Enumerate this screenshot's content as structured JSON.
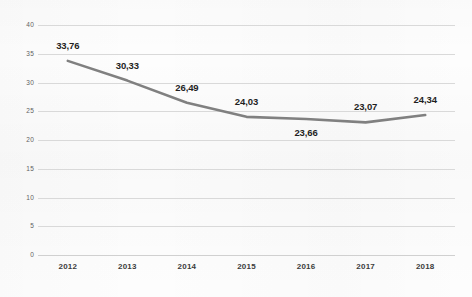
{
  "chart_data": {
    "type": "line",
    "title": "",
    "subtitle": "",
    "xlabel": "",
    "ylabel": "",
    "categories": [
      "2012",
      "2013",
      "2014",
      "2015",
      "2016",
      "2017",
      "2018"
    ],
    "values": [
      33.76,
      30.33,
      26.49,
      24.03,
      23.66,
      23.07,
      24.34
    ],
    "data_labels": [
      "33,76",
      "30,33",
      "26,49",
      "24,03",
      "23,66",
      "23,07",
      "24,34"
    ],
    "label_positions": [
      "above",
      "above",
      "above",
      "above",
      "below",
      "above",
      "above"
    ],
    "series": [
      {
        "name": "",
        "values": [
          33.76,
          30.33,
          26.49,
          24.03,
          23.66,
          23.07,
          24.34
        ],
        "color": "#808080"
      }
    ],
    "ylim": [
      0,
      40
    ],
    "ytick_labels": [
      "0",
      "5",
      "10",
      "15",
      "20",
      "25",
      "30",
      "35",
      "40"
    ],
    "ytick_values": [
      0,
      5,
      10,
      15,
      20,
      25,
      30,
      35,
      40
    ],
    "grid": true,
    "grid_axis": "y",
    "legend": false,
    "legend_position": "none",
    "markers": false,
    "decimal_separator": ",",
    "colors": {
      "line": "#808080",
      "gridline": "#d9d9d9",
      "axis_text": "#5f5f5f",
      "label_text": "#1f1f1f",
      "background": "#fdfdfd"
    }
  }
}
